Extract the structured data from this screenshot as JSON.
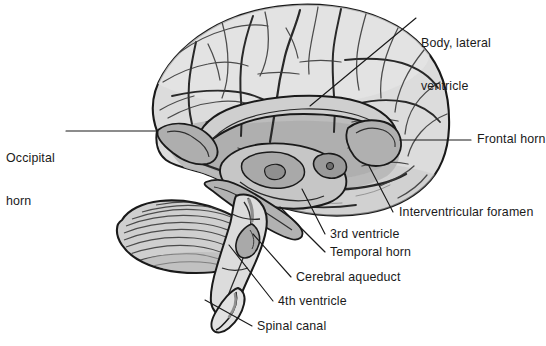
{
  "figure": {
    "type": "anatomical-illustration",
    "width": 542,
    "height": 346,
    "background_color": "#ffffff",
    "ink_color": "#1a1a1a",
    "brain_fill_color": "#d9d9d9",
    "ventricle_fill_color": "#b4b4b4",
    "cerebellum_fill_color": "#cfcfcf",
    "brainstem_fill_color": "#dcdcdc",
    "leader_line_color": "#1a1a1a"
  },
  "labels": [
    {
      "id": "body-lateral-ventricle",
      "name": "body-lateral-ventricle-label",
      "line1": "Body, lateral",
      "line2": "ventricle",
      "text_x": 421,
      "text_y": 7,
      "leader": {
        "x1": 416,
        "y1": 18,
        "x2": 310,
        "y2": 106
      },
      "side": "right"
    },
    {
      "id": "occipital-horn",
      "name": "occipital-horn-label",
      "line1": "Occipital",
      "line2": "horn",
      "text_x": 6,
      "text_y": 122,
      "leader": {
        "x1": 66,
        "y1": 131,
        "x2": 157,
        "y2": 131
      },
      "side": "left"
    },
    {
      "id": "frontal-horn",
      "name": "frontal-horn-label",
      "line1": "Frontal horn",
      "line2": "",
      "text_x": 477,
      "text_y": 133,
      "leader": {
        "x1": 400,
        "y1": 140,
        "x2": 471,
        "y2": 140
      },
      "side": "right"
    },
    {
      "id": "interventricular-foramen",
      "name": "interventricular-foramen-label",
      "line1": "Interventricular foramen",
      "line2": "",
      "text_x": 399,
      "text_y": 206,
      "leader": {
        "x1": 369,
        "y1": 166,
        "x2": 393,
        "y2": 212
      },
      "side": "right"
    },
    {
      "id": "third-ventricle",
      "name": "third-ventricle-label",
      "line1": "3rd ventricle",
      "line2": "",
      "text_x": 330,
      "text_y": 228,
      "leader": {
        "x1": 302,
        "y1": 189,
        "x2": 325,
        "y2": 234
      },
      "side": "right"
    },
    {
      "id": "temporal-horn",
      "name": "temporal-horn-label",
      "line1": "Temporal horn",
      "line2": "",
      "text_x": 330,
      "text_y": 246,
      "leader": {
        "x1": 280,
        "y1": 207,
        "x2": 325,
        "y2": 252
      },
      "side": "right"
    },
    {
      "id": "cerebral-aqueduct",
      "name": "cerebral-aqueduct-label",
      "line1": "Cerebral aqueduct",
      "line2": "",
      "text_x": 296,
      "text_y": 271,
      "leader": {
        "x1": 253,
        "y1": 234,
        "x2": 291,
        "y2": 277
      },
      "side": "right"
    },
    {
      "id": "fourth-ventricle",
      "name": "fourth-ventricle-label",
      "line1": "4th ventricle",
      "line2": "",
      "text_x": 278,
      "text_y": 295,
      "leader": {
        "x1": 229,
        "y1": 245,
        "x2": 273,
        "y2": 301
      },
      "side": "right"
    },
    {
      "id": "spinal-canal",
      "name": "spinal-canal-label",
      "line1": "Spinal canal",
      "line2": "",
      "text_x": 257,
      "text_y": 320,
      "leader": {
        "x1": 205,
        "y1": 300,
        "x2": 252,
        "y2": 326
      },
      "side": "right"
    }
  ],
  "structures": [
    {
      "id": "cerebrum",
      "name": "cerebrum",
      "fill": "#d9d9d9"
    },
    {
      "id": "lateral-ventricle",
      "name": "lateral-ventricle",
      "fill": "#b4b4b4"
    },
    {
      "id": "third-ventricle",
      "name": "third-ventricle",
      "fill": "#b8b8b8"
    },
    {
      "id": "cerebellum",
      "name": "cerebellum",
      "fill": "#cfcfcf"
    },
    {
      "id": "brainstem",
      "name": "brainstem",
      "fill": "#dcdcdc"
    },
    {
      "id": "corpus-callosum",
      "name": "corpus-callosum",
      "fill": "#cccccc"
    },
    {
      "id": "spinal-cord",
      "name": "spinal-cord",
      "fill": "#e2e2e2"
    }
  ]
}
